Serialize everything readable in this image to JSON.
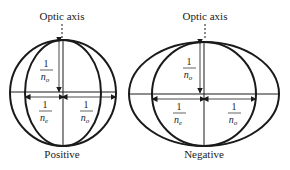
{
  "figures": [
    {
      "title": "Optic axis",
      "caption": "Positive",
      "vertical_fraction": {
        "num": "1",
        "den": "n",
        "sub": "o"
      },
      "left_fraction": {
        "num": "1",
        "den": "n",
        "sub": "e"
      },
      "right_fraction": {
        "num": "1",
        "den": "n",
        "sub": "o"
      }
    },
    {
      "title": "Optic axis",
      "caption": "Negative",
      "vertical_fraction": {
        "num": "1",
        "den": "n",
        "sub": "o"
      },
      "left_fraction": {
        "num": "1",
        "den": "n",
        "sub": "e"
      },
      "right_fraction": {
        "num": "1",
        "den": "n",
        "sub": "o"
      }
    }
  ],
  "colors": {
    "stroke": "#1a1a1a",
    "background": "#ffffff"
  }
}
